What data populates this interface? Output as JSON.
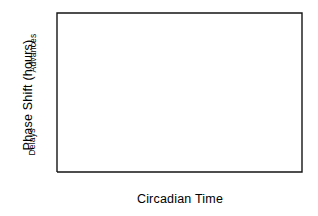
{
  "chart_data": {
    "type": "line",
    "title": "",
    "xlabel": "Circadian Time",
    "ylabel": "Phase Shift (hours)",
    "ylabel_upper": "Advances",
    "ylabel_lower": "Delays",
    "xlim": [
      0,
      24
    ],
    "ylim": [
      -1,
      2
    ],
    "xticks": [
      0,
      3,
      6,
      9,
      12,
      15,
      18,
      21,
      24
    ],
    "xticklabels": [
      "0",
      "3",
      "6",
      "9",
      "12",
      "15",
      "18",
      "21",
      "24"
    ],
    "yticks": [
      -1,
      0,
      1,
      2
    ],
    "yticklabels": [
      "-1",
      "0",
      "1",
      "2"
    ],
    "grid": false,
    "legend": false,
    "zero_reference_line": 0,
    "series": [
      {
        "name": "Phase Response Curve",
        "color": "#1a1a1a",
        "x": [
          0.0,
          1.0,
          2.0,
          3.0,
          4.0,
          5.0,
          6.0,
          7.0,
          8.0,
          9.0,
          9.5,
          10.0,
          10.5,
          11.0,
          11.5,
          12.0,
          12.5,
          13.0,
          13.5,
          14.0,
          14.5,
          15.0,
          15.4,
          15.8,
          16.2,
          16.6,
          17.0,
          17.3,
          17.6,
          18.0,
          18.5,
          19.0,
          19.5,
          20.0,
          20.5,
          21.0,
          21.5,
          22.0,
          22.5,
          23.0,
          23.5,
          24.0
        ],
        "y": [
          0.0,
          0.0,
          0.0,
          0.0,
          0.0,
          0.0,
          0.0,
          0.0,
          0.0,
          0.0,
          -0.02,
          -0.09,
          -0.22,
          -0.4,
          -0.58,
          -0.74,
          -0.86,
          -0.92,
          -0.93,
          -0.88,
          -0.7,
          -0.36,
          0.0,
          0.48,
          1.02,
          1.55,
          1.91,
          2.0,
          1.97,
          1.86,
          1.64,
          1.36,
          1.06,
          0.78,
          0.55,
          0.37,
          0.25,
          0.17,
          0.11,
          0.07,
          0.05,
          0.04
        ]
      }
    ],
    "annotations": [
      {
        "id": "A",
        "label": "A",
        "x": 2.9,
        "y": 0.08
      },
      {
        "id": "B",
        "label": "B",
        "x": 13.6,
        "y": -0.72
      },
      {
        "id": "C",
        "label": "C",
        "x": 17.6,
        "y": 1.84
      }
    ]
  },
  "axes": {
    "x_axis_label": "Circadian Time",
    "y_axis_label": "Phase Shift (hours)",
    "y_region_upper": "Advances",
    "y_region_lower": "Delays"
  }
}
